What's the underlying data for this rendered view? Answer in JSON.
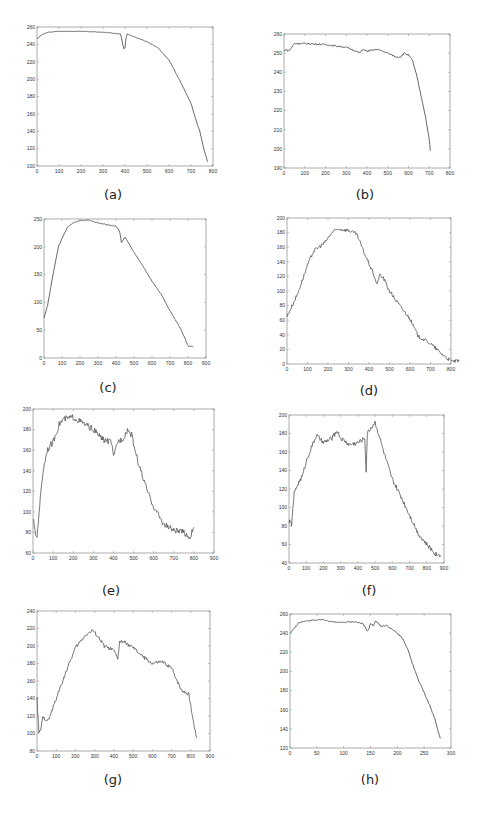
{
  "figure": {
    "background": "#ffffff",
    "line_color": "#555555",
    "axis_color": "#888888"
  },
  "chart_data": [
    {
      "id": "a",
      "caption": "(a)",
      "type": "line",
      "box": [
        37,
        27,
        213,
        166
      ],
      "caption_pos": [
        113,
        196
      ],
      "xlim": [
        0,
        800
      ],
      "ylim": [
        100,
        260
      ],
      "xticks": [
        0,
        100,
        200,
        300,
        400,
        500,
        600,
        700,
        800
      ],
      "yticks": [
        100,
        120,
        140,
        160,
        180,
        200,
        220,
        240,
        260
      ],
      "noise": 0.3,
      "x": [
        0,
        20,
        50,
        100,
        200,
        300,
        380,
        390,
        395,
        400,
        405,
        410,
        450,
        500,
        550,
        600,
        650,
        700,
        720,
        740,
        760,
        775
      ],
      "y": [
        246,
        251,
        254,
        255,
        255,
        254,
        252,
        240,
        235,
        236,
        248,
        252,
        248,
        243,
        236,
        222,
        198,
        172,
        155,
        140,
        118,
        105
      ]
    },
    {
      "id": "b",
      "caption": "(b)",
      "type": "line",
      "box": [
        284,
        34,
        450,
        168
      ],
      "caption_pos": [
        365,
        196
      ],
      "xlim": [
        0,
        800
      ],
      "ylim": [
        190,
        260
      ],
      "xticks": [
        0,
        100,
        200,
        300,
        400,
        500,
        600,
        700,
        800
      ],
      "yticks": [
        190,
        200,
        210,
        220,
        230,
        240,
        250,
        260
      ],
      "noise": 0.4,
      "x": [
        0,
        10,
        20,
        30,
        50,
        100,
        200,
        300,
        350,
        365,
        380,
        400,
        450,
        500,
        540,
        560,
        580,
        600,
        620,
        640,
        660,
        680,
        700,
        705
      ],
      "y": [
        251,
        252,
        251,
        252,
        255,
        255,
        254.5,
        253,
        251,
        250,
        252,
        251,
        252,
        250,
        248,
        248,
        250,
        249,
        246,
        238,
        228,
        218,
        205,
        199
      ]
    },
    {
      "id": "c",
      "caption": "(c)",
      "type": "line",
      "box": [
        44,
        219,
        206,
        358
      ],
      "caption_pos": [
        108,
        389
      ],
      "xlim": [
        0,
        900
      ],
      "ylim": [
        0,
        250
      ],
      "xticks": [
        0,
        100,
        200,
        300,
        400,
        500,
        600,
        700,
        800,
        900
      ],
      "yticks": [
        0,
        50,
        100,
        150,
        200,
        250
      ],
      "noise": 0.6,
      "x": [
        0,
        20,
        50,
        80,
        100,
        130,
        160,
        200,
        250,
        300,
        350,
        400,
        420,
        430,
        450,
        460,
        500,
        550,
        600,
        650,
        700,
        760,
        790,
        800,
        830
      ],
      "y": [
        72,
        95,
        150,
        200,
        215,
        235,
        243,
        247,
        248,
        243,
        240,
        237,
        228,
        208,
        218,
        212,
        190,
        165,
        138,
        115,
        85,
        52,
        30,
        22,
        20
      ]
    },
    {
      "id": "d",
      "caption": "(d)",
      "type": "line",
      "box": [
        287,
        218,
        451,
        364
      ],
      "caption_pos": [
        369,
        392
      ],
      "xlim": [
        0,
        800
      ],
      "ylim": [
        0,
        200
      ],
      "xticks": [
        0,
        100,
        200,
        300,
        400,
        500,
        600,
        700,
        800
      ],
      "yticks": [
        0,
        20,
        40,
        60,
        80,
        100,
        120,
        140,
        160,
        180,
        200
      ],
      "noise": 2.5,
      "x": [
        0,
        50,
        100,
        130,
        180,
        220,
        250,
        300,
        340,
        380,
        420,
        440,
        450,
        470,
        500,
        550,
        600,
        640,
        700,
        750,
        800,
        840
      ],
      "y": [
        65,
        95,
        135,
        155,
        165,
        180,
        185,
        183,
        178,
        150,
        125,
        108,
        122,
        118,
        100,
        80,
        62,
        38,
        28,
        15,
        4,
        4
      ]
    },
    {
      "id": "e",
      "caption": "(e)",
      "type": "line",
      "box": [
        33,
        409,
        214,
        553
      ],
      "caption_pos": [
        111,
        592
      ],
      "xlim": [
        0,
        900
      ],
      "ylim": [
        60,
        200
      ],
      "xticks": [
        0,
        100,
        200,
        300,
        400,
        500,
        600,
        700,
        800,
        900
      ],
      "yticks": [
        60,
        80,
        100,
        120,
        140,
        160,
        180,
        200
      ],
      "noise": 3,
      "x": [
        0,
        10,
        20,
        30,
        50,
        70,
        100,
        130,
        150,
        200,
        250,
        300,
        350,
        390,
        400,
        420,
        450,
        470,
        490,
        520,
        560,
        600,
        650,
        700,
        750,
        780,
        800
      ],
      "y": [
        95,
        80,
        75,
        100,
        140,
        160,
        168,
        185,
        190,
        192,
        186,
        180,
        170,
        168,
        152,
        168,
        172,
        180,
        175,
        150,
        125,
        105,
        88,
        82,
        80,
        75,
        85
      ]
    },
    {
      "id": "f",
      "caption": "(f)",
      "type": "line",
      "box": [
        289,
        415,
        444,
        563
      ],
      "caption_pos": [
        369,
        592
      ],
      "xlim": [
        0,
        900
      ],
      "ylim": [
        40,
        200
      ],
      "xticks": [
        0,
        100,
        200,
        300,
        400,
        500,
        600,
        700,
        800,
        900
      ],
      "yticks": [
        40,
        60,
        80,
        100,
        120,
        140,
        160,
        180,
        200
      ],
      "noise": 2.5,
      "x": [
        0,
        15,
        30,
        50,
        80,
        100,
        130,
        160,
        200,
        250,
        280,
        300,
        350,
        400,
        440,
        448,
        455,
        470,
        500,
        520,
        550,
        600,
        650,
        700,
        750,
        800,
        850,
        880
      ],
      "y": [
        85,
        82,
        115,
        125,
        135,
        150,
        165,
        178,
        170,
        175,
        183,
        175,
        168,
        170,
        175,
        140,
        180,
        185,
        192,
        180,
        160,
        130,
        112,
        92,
        72,
        60,
        50,
        48
      ]
    },
    {
      "id": "g",
      "caption": "(g)",
      "type": "line",
      "box": [
        37,
        611,
        210,
        751
      ],
      "caption_pos": [
        113,
        781
      ],
      "xlim": [
        0,
        900
      ],
      "ylim": [
        80,
        240
      ],
      "xticks": [
        0,
        100,
        200,
        300,
        400,
        500,
        600,
        700,
        800,
        900
      ],
      "yticks": [
        80,
        100,
        120,
        140,
        160,
        180,
        200,
        220,
        240
      ],
      "noise": 2,
      "x": [
        0,
        10,
        20,
        30,
        60,
        100,
        150,
        200,
        250,
        290,
        320,
        350,
        400,
        420,
        430,
        450,
        500,
        550,
        600,
        650,
        700,
        750,
        790,
        810,
        830
      ],
      "y": [
        140,
        100,
        105,
        118,
        115,
        140,
        170,
        198,
        212,
        218,
        210,
        200,
        195,
        185,
        205,
        205,
        198,
        188,
        180,
        182,
        175,
        150,
        145,
        118,
        95
      ]
    },
    {
      "id": "h",
      "caption": "(h)",
      "type": "line",
      "box": [
        290,
        614,
        451,
        748
      ],
      "caption_pos": [
        370,
        781
      ],
      "xlim": [
        0,
        300
      ],
      "ylim": [
        120,
        260
      ],
      "xticks": [
        0,
        50,
        100,
        150,
        200,
        250,
        300
      ],
      "yticks": [
        120,
        140,
        160,
        180,
        200,
        220,
        240,
        260
      ],
      "noise": 0.7,
      "x": [
        0,
        3,
        8,
        15,
        30,
        60,
        90,
        120,
        135,
        140,
        145,
        150,
        155,
        160,
        170,
        180,
        200,
        210,
        220,
        230,
        240,
        250,
        260,
        270,
        280
      ],
      "y": [
        240,
        242,
        245,
        250,
        253,
        254,
        251,
        252,
        250,
        246,
        242,
        250,
        248,
        253,
        247,
        248,
        240,
        234,
        222,
        205,
        190,
        178,
        165,
        150,
        130
      ]
    }
  ]
}
